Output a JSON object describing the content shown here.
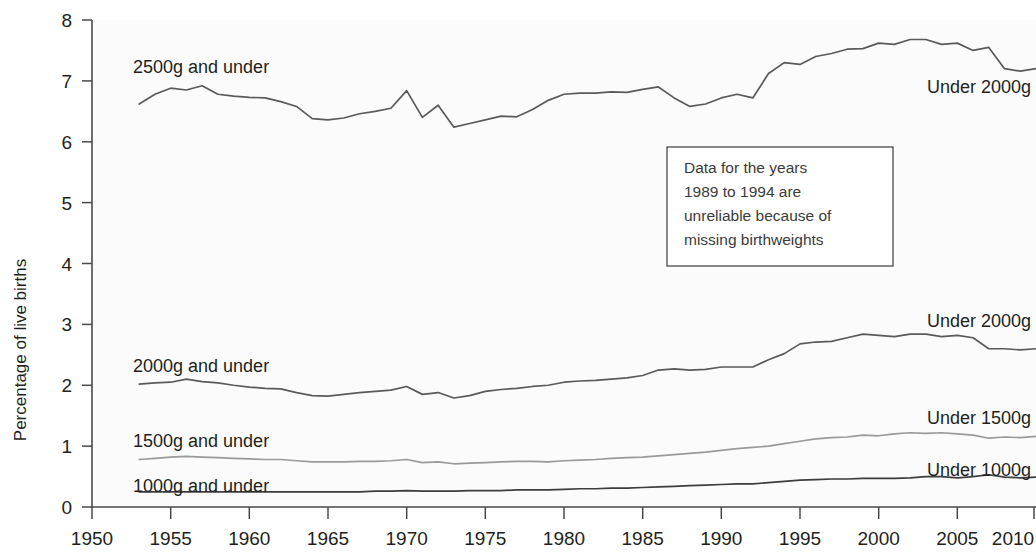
{
  "chart_data": {
    "type": "line",
    "title": "",
    "xlabel": "",
    "ylabel": "Percentage of live births",
    "xlim": [
      1950,
      2010
    ],
    "ylim": [
      0,
      8
    ],
    "grid": false,
    "legend_position": "inline-labels",
    "x_ticks": [
      1950,
      1955,
      1960,
      1965,
      1970,
      1975,
      1980,
      1985,
      1990,
      1995,
      2000,
      2005,
      2010
    ],
    "y_ticks": [
      0,
      1,
      2,
      3,
      4,
      5,
      6,
      7,
      8
    ],
    "x": [
      1953,
      1954,
      1955,
      1956,
      1957,
      1958,
      1959,
      1960,
      1961,
      1962,
      1963,
      1964,
      1965,
      1966,
      1967,
      1968,
      1969,
      1970,
      1971,
      1972,
      1973,
      1974,
      1975,
      1976,
      1977,
      1978,
      1979,
      1980,
      1981,
      1982,
      1983,
      1984,
      1985,
      1986,
      1987,
      1988,
      1989,
      1990,
      1991,
      1992,
      1993,
      1994,
      1995,
      1996,
      1997,
      1998,
      1999,
      2000,
      2001,
      2002,
      2003,
      2004,
      2005,
      2006,
      2007,
      2008,
      2009,
      2010
    ],
    "series": [
      {
        "name": "2500g and under",
        "label_left": "2500g and under",
        "label_right": "Under 2000g",
        "color": "#5a5a5a",
        "values": [
          6.62,
          6.78,
          6.88,
          6.85,
          6.92,
          6.78,
          6.75,
          6.73,
          6.72,
          6.66,
          6.58,
          6.38,
          6.36,
          6.39,
          6.46,
          6.5,
          6.55,
          6.84,
          6.4,
          6.6,
          6.24,
          6.3,
          6.36,
          6.42,
          6.41,
          6.53,
          6.68,
          6.78,
          6.8,
          6.8,
          6.82,
          6.81,
          6.86,
          6.9,
          6.72,
          6.58,
          6.62,
          6.72,
          6.78,
          6.72,
          7.12,
          7.3,
          7.27,
          7.4,
          7.45,
          7.52,
          7.53,
          7.62,
          7.6,
          7.68,
          7.68,
          7.6,
          7.62,
          7.5,
          7.55,
          7.2,
          7.16,
          7.2
        ]
      },
      {
        "name": "2000g and under",
        "label_left": "2000g and under",
        "label_right": "Under 2000g",
        "color": "#5a5a5a",
        "values": [
          2.02,
          2.04,
          2.05,
          2.1,
          2.06,
          2.04,
          2.0,
          1.97,
          1.95,
          1.94,
          1.88,
          1.83,
          1.82,
          1.85,
          1.88,
          1.9,
          1.92,
          1.98,
          1.85,
          1.88,
          1.79,
          1.83,
          1.9,
          1.93,
          1.95,
          1.98,
          2.0,
          2.05,
          2.07,
          2.08,
          2.1,
          2.12,
          2.16,
          2.25,
          2.27,
          2.25,
          2.26,
          2.3,
          2.3,
          2.3,
          2.42,
          2.52,
          2.68,
          2.71,
          2.72,
          2.78,
          2.84,
          2.82,
          2.8,
          2.84,
          2.84,
          2.8,
          2.82,
          2.78,
          2.6,
          2.6,
          2.58,
          2.6
        ]
      },
      {
        "name": "1500g and under",
        "label_left": "1500g and under",
        "label_right": "Under 1500g",
        "color": "#9a9a9a",
        "values": [
          0.78,
          0.8,
          0.82,
          0.83,
          0.82,
          0.81,
          0.8,
          0.79,
          0.78,
          0.78,
          0.76,
          0.74,
          0.74,
          0.74,
          0.75,
          0.75,
          0.76,
          0.78,
          0.73,
          0.74,
          0.71,
          0.72,
          0.73,
          0.74,
          0.75,
          0.75,
          0.74,
          0.76,
          0.77,
          0.78,
          0.8,
          0.81,
          0.82,
          0.84,
          0.86,
          0.88,
          0.9,
          0.93,
          0.96,
          0.98,
          1.0,
          1.04,
          1.08,
          1.12,
          1.14,
          1.15,
          1.18,
          1.17,
          1.2,
          1.22,
          1.21,
          1.22,
          1.2,
          1.18,
          1.13,
          1.15,
          1.14,
          1.16
        ]
      },
      {
        "name": "1000g and under",
        "label_left": "1000g and under",
        "label_right": "Under 1000g",
        "color": "#3d3d3d",
        "values": [
          0.25,
          0.25,
          0.25,
          0.25,
          0.25,
          0.25,
          0.25,
          0.25,
          0.25,
          0.25,
          0.25,
          0.25,
          0.25,
          0.25,
          0.25,
          0.26,
          0.26,
          0.27,
          0.26,
          0.26,
          0.26,
          0.27,
          0.27,
          0.27,
          0.28,
          0.28,
          0.28,
          0.29,
          0.3,
          0.3,
          0.31,
          0.31,
          0.32,
          0.33,
          0.34,
          0.35,
          0.36,
          0.37,
          0.38,
          0.38,
          0.4,
          0.42,
          0.44,
          0.45,
          0.46,
          0.46,
          0.47,
          0.47,
          0.47,
          0.48,
          0.5,
          0.5,
          0.48,
          0.5,
          0.53,
          0.49,
          0.48,
          0.49
        ]
      }
    ],
    "annotations": [
      {
        "name": "data-reliability-note",
        "lines": [
          "Data for the years",
          "1989 to 1994 are",
          "unreliable because of",
          "missing birthweights"
        ]
      }
    ]
  },
  "axis": {
    "y_title": "Percentage of live births",
    "y_tick_labels": [
      "8",
      "7",
      "6",
      "5",
      "4",
      "3",
      "2",
      "1",
      "0"
    ],
    "x_tick_labels": [
      "1950",
      "1955",
      "1960",
      "1965",
      "1970",
      "1975",
      "1980",
      "1985",
      "1990",
      "1995",
      "2000",
      "2005",
      "2010"
    ]
  },
  "labels": {
    "left": {
      "s2500": "2500g and under",
      "s2000": "2000g and under",
      "s1500": "1500g and under",
      "s1000": "1000g and under"
    },
    "right": {
      "top": "Under 2000g",
      "s2000": "Under 2000g",
      "s1500": "Under 1500g",
      "s1000": "Under 1000g"
    }
  },
  "note": {
    "line1": "Data for the years",
    "line2": "1989 to 1994 are",
    "line3": "unreliable because of",
    "line4": "missing birthweights"
  }
}
